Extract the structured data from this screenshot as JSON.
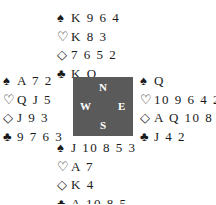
{
  "suits": {
    "spades": "♠",
    "hearts": "♡",
    "diamonds": "◇",
    "clubs": "♣"
  },
  "hands": {
    "north": {
      "spades": "K 9 6 4",
      "hearts": "K 8 3",
      "diamonds": "7 6 5 2",
      "clubs": "K Q"
    },
    "west": {
      "spades": "A 7 2",
      "hearts": "Q J 5",
      "diamonds": "J 9 3",
      "clubs": "9 7 6 3"
    },
    "east": {
      "spades": "Q",
      "hearts": "10 9 6 4 2",
      "diamonds": "A Q 10 8",
      "clubs": "J 4 2"
    },
    "south": {
      "spades": "J 10 8 5 3",
      "hearts": "A 7",
      "diamonds": "K 4",
      "clubs": "A 10 8 5"
    }
  },
  "compass": {
    "north": "N",
    "west": "W",
    "east": "E",
    "south": "S",
    "background": "#5a5a5a"
  }
}
